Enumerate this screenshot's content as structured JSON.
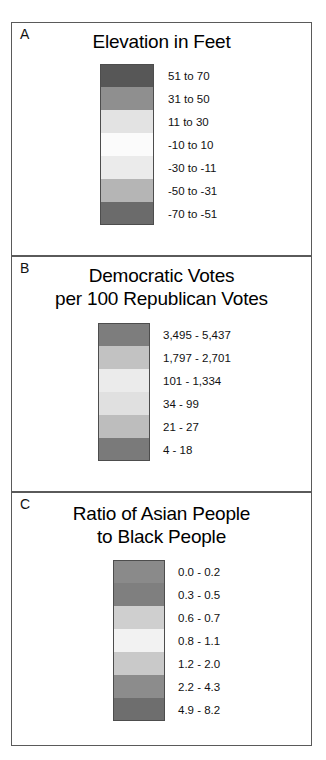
{
  "figure": {
    "background": "#ffffff",
    "border_color": "#5a5a5a"
  },
  "panels": [
    {
      "letter": "A",
      "title": "Elevation in Feet",
      "title_lines": [
        "Elevation in Feet"
      ],
      "legend": [
        {
          "label": "51 to 70",
          "color": "#575757"
        },
        {
          "label": "31 to 50",
          "color": "#8f8f8f"
        },
        {
          "label": "11 to 30",
          "color": "#e3e3e3"
        },
        {
          "label": "-10 to 10",
          "color": "#fbfbfb"
        },
        {
          "label": "-30 to -11",
          "color": "#ebebeb"
        },
        {
          "label": "-50 to -31",
          "color": "#b5b5b5"
        },
        {
          "label": "-70 to -51",
          "color": "#6b6b6b"
        }
      ]
    },
    {
      "letter": "B",
      "title": "Democratic Votes per 100 Republican Votes",
      "title_lines": [
        "Democratic Votes",
        "per 100 Republican Votes"
      ],
      "legend": [
        {
          "label": "3,495 - 5,437",
          "color": "#7d7d7d"
        },
        {
          "label": "1,797 - 2,701",
          "color": "#c2c2c2"
        },
        {
          "label": "101 - 1,334",
          "color": "#ebebeb"
        },
        {
          "label": "34 - 99",
          "color": "#e0e0e0"
        },
        {
          "label": "21 - 27",
          "color": "#bdbdbd"
        },
        {
          "label": "4 - 18",
          "color": "#7a7a7a"
        }
      ]
    },
    {
      "letter": "C",
      "title": "Ratio of Asian People to Black People",
      "title_lines": [
        "Ratio of Asian People",
        "to Black People"
      ],
      "legend": [
        {
          "label": "0.0 - 0.2",
          "color": "#8a8a8a"
        },
        {
          "label": "0.3 - 0.5",
          "color": "#7f7f7f"
        },
        {
          "label": "0.6 - 0.7",
          "color": "#cfcfcf"
        },
        {
          "label": "0.8 - 1.1",
          "color": "#f2f2f2"
        },
        {
          "label": "1.2 - 2.0",
          "color": "#c9c9c9"
        },
        {
          "label": "2.2 - 4.3",
          "color": "#8c8c8c"
        },
        {
          "label": "4.9 - 8.2",
          "color": "#6e6e6e"
        }
      ]
    }
  ],
  "chart_data": {
    "type": "table",
    "xlabel": "",
    "ylabel": "",
    "legends": [
      {
        "panel": "A",
        "title": "Elevation in Feet",
        "unit": "feet",
        "class_count": 7,
        "categories": [
          "51 to 70",
          "31 to 50",
          "11 to 30",
          "-10 to 10",
          "-30 to -11",
          "-50 to -31",
          "-70 to -51"
        ],
        "bins": [
          [
            51,
            70
          ],
          [
            31,
            50
          ],
          [
            11,
            30
          ],
          [
            -10,
            10
          ],
          [
            -30,
            -11
          ],
          [
            -50,
            -31
          ],
          [
            -70,
            -51
          ]
        ],
        "colors": [
          "#575757",
          "#8f8f8f",
          "#e3e3e3",
          "#fbfbfb",
          "#ebebeb",
          "#b5b5b5",
          "#6b6b6b"
        ]
      },
      {
        "panel": "B",
        "title": "Democratic Votes per 100 Republican Votes",
        "unit": "Democratic votes per 100 Republican votes",
        "class_count": 6,
        "categories": [
          "3,495 - 5,437",
          "1,797 - 2,701",
          "101 - 1,334",
          "34 - 99",
          "21 - 27",
          "4 - 18"
        ],
        "bins": [
          [
            3495,
            5437
          ],
          [
            1797,
            2701
          ],
          [
            101,
            1334
          ],
          [
            34,
            99
          ],
          [
            21,
            27
          ],
          [
            4,
            18
          ]
        ],
        "colors": [
          "#7d7d7d",
          "#c2c2c2",
          "#ebebeb",
          "#e0e0e0",
          "#bdbdbd",
          "#7a7a7a"
        ]
      },
      {
        "panel": "C",
        "title": "Ratio of Asian People to Black People",
        "unit": "ratio",
        "class_count": 7,
        "categories": [
          "0.0 - 0.2",
          "0.3 - 0.5",
          "0.6 - 0.7",
          "0.8 - 1.1",
          "1.2 - 2.0",
          "2.2 - 4.3",
          "4.9 - 8.2"
        ],
        "bins": [
          [
            0.0,
            0.2
          ],
          [
            0.3,
            0.5
          ],
          [
            0.6,
            0.7
          ],
          [
            0.8,
            1.1
          ],
          [
            1.2,
            2.0
          ],
          [
            2.2,
            4.3
          ],
          [
            4.9,
            8.2
          ]
        ],
        "colors": [
          "#8a8a8a",
          "#7f7f7f",
          "#cfcfcf",
          "#f2f2f2",
          "#c9c9c9",
          "#8c8c8c",
          "#6e6e6e"
        ]
      }
    ]
  }
}
